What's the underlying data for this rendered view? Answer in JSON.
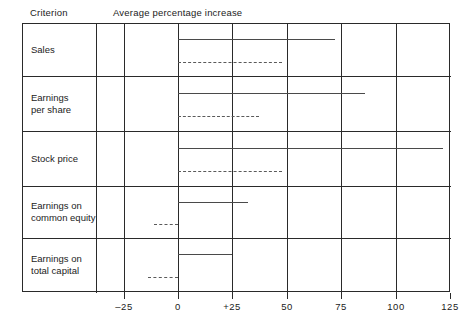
{
  "header": {
    "criterion_label": "Criterion",
    "axis_label": "Average percentage increase"
  },
  "chart_data": {
    "type": "bar",
    "title": "Average percentage increase",
    "xlabel": "Average percentage increase",
    "ylabel": "Criterion",
    "xlim": [
      -25,
      125
    ],
    "grid": true,
    "legend": "none",
    "orientation": "horizontal",
    "xticks": [
      -25,
      0,
      25,
      50,
      75,
      100,
      125
    ],
    "xticklabels": [
      "–25",
      "0",
      "+25",
      "50",
      "75",
      "100",
      "125"
    ],
    "categories": [
      "Sales",
      "Earnings per share",
      "Stock price",
      "Earnings on common equity",
      "Earnings on total capital"
    ],
    "series": [
      {
        "name": "solid",
        "style": "solid",
        "values": [
          72,
          86,
          122,
          32,
          25
        ],
        "starts": [
          0,
          0,
          0,
          0,
          0
        ]
      },
      {
        "name": "dashed",
        "style": "dashed",
        "values": [
          48,
          37,
          48,
          0,
          0
        ],
        "starts": [
          0,
          0,
          0,
          -11,
          -14
        ]
      }
    ]
  },
  "rows": [
    {
      "label": "Sales"
    },
    {
      "label": "Earnings\nper share"
    },
    {
      "label": "Stock price"
    },
    {
      "label": "Earnings on\ncommon equity"
    },
    {
      "label": "Earnings on\ntotal capital"
    }
  ],
  "axis": {
    "ticks": [
      {
        "value": -25,
        "label": "–25"
      },
      {
        "value": 0,
        "label": "0"
      },
      {
        "value": 25,
        "label": "+25"
      },
      {
        "value": 50,
        "label": "50"
      },
      {
        "value": 75,
        "label": "75"
      },
      {
        "value": 100,
        "label": "100"
      },
      {
        "value": 125,
        "label": "125"
      }
    ]
  },
  "colors": {
    "frame": "#2a2a2a",
    "solid_bar": "#4a4a4a",
    "dashed_bar": "#5a5a5a",
    "text": "#222222",
    "background": "#ffffff"
  }
}
